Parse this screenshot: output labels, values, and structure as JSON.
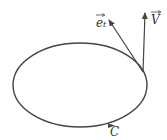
{
  "diagram": {
    "curve_label": "C",
    "vectors": [
      {
        "name": "e_t",
        "label": "e",
        "subscript": "t",
        "has_arrow_over": true
      },
      {
        "name": "V",
        "label": "V",
        "has_arrow_over": true
      }
    ],
    "colors": {
      "stroke": "#444444",
      "background": "#ffffff"
    }
  }
}
